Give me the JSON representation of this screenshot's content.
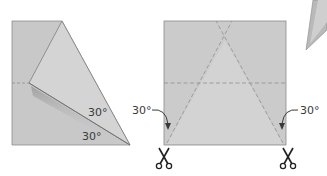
{
  "figures": {
    "folded_paper": {
      "angle_upper": "30°",
      "angle_lower": "30°"
    },
    "unfolded_square": {
      "angle_left": "30°",
      "angle_right": "30°",
      "scissors_left": "scissors-icon",
      "scissors_right": "scissors-icon"
    },
    "partial_shape": "paper-airplane-tip"
  },
  "colors": {
    "paper": "#c9c9c9",
    "paper_light": "#d6d6d6",
    "paper_shadow": "#a8a8a8",
    "edge": "#8a8a8a",
    "dash": "#8f8f8f",
    "text": "#3a3a3a",
    "background": "#ffffff"
  }
}
